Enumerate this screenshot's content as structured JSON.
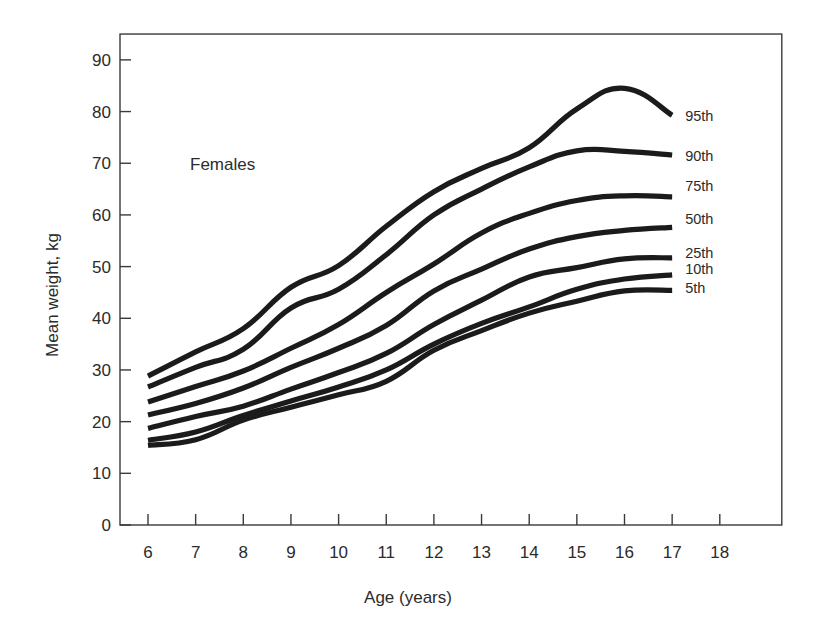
{
  "figure": {
    "annotation": "Females",
    "background": "#ffffff",
    "line_color": "#1b1b1b",
    "axis_color": "#3a3a3a"
  },
  "chart_data": {
    "type": "line",
    "title": "",
    "subtitle": "",
    "annotation": "Females",
    "xlabel": "Age (years)",
    "ylabel": "Mean weight, kg",
    "xlim": [
      6,
      18
    ],
    "ylim": [
      0,
      95
    ],
    "xticks": [
      6,
      7,
      8,
      9,
      10,
      11,
      12,
      13,
      14,
      15,
      16,
      17,
      18
    ],
    "xtick_labels": [
      "6",
      "7",
      "8",
      "9",
      "10",
      "11",
      "12",
      "13",
      "14",
      "15",
      "16",
      "17",
      "18"
    ],
    "yticks": [
      0,
      10,
      20,
      30,
      40,
      50,
      60,
      70,
      80,
      90
    ],
    "ytick_labels": [
      "0",
      "10",
      "20",
      "30",
      "40",
      "50",
      "60",
      "70",
      "80",
      "90"
    ],
    "grid": false,
    "legend_position": "right-inline",
    "x": [
      6,
      7,
      8,
      9,
      10,
      11,
      12,
      13,
      14,
      15,
      16,
      17
    ],
    "series": [
      {
        "name": "95th",
        "label": "95th",
        "label_y": 79.3,
        "values": [
          28.8,
          33.5,
          38.0,
          46.0,
          50.2,
          57.8,
          64.5,
          69.0,
          73.0,
          80.5,
          84.5,
          79.3
        ]
      },
      {
        "name": "90th",
        "label": "90th",
        "label_y": 71.6,
        "values": [
          26.7,
          30.5,
          34.0,
          42.0,
          45.6,
          52.3,
          60.0,
          65.0,
          69.3,
          72.4,
          72.3,
          71.6
        ]
      },
      {
        "name": "75th",
        "label": "75th",
        "label_y": 65.8,
        "values": [
          23.8,
          26.8,
          29.8,
          34.2,
          38.8,
          45.0,
          50.5,
          56.5,
          60.3,
          62.8,
          63.7,
          63.5
        ]
      },
      {
        "name": "50th",
        "label": "50th",
        "label_y": 59.4,
        "values": [
          21.3,
          23.5,
          26.5,
          30.5,
          34.2,
          38.6,
          45.3,
          49.5,
          53.4,
          55.8,
          57.0,
          57.6
        ]
      },
      {
        "name": "25th",
        "label": "25th",
        "label_y": 52.8,
        "values": [
          18.7,
          21.0,
          23.0,
          26.3,
          29.5,
          33.2,
          38.8,
          43.5,
          48.0,
          49.8,
          51.5,
          51.7
        ]
      },
      {
        "name": "10th",
        "label": "10th",
        "label_y": 49.7,
        "values": [
          16.4,
          18.0,
          21.2,
          24.0,
          26.7,
          30.0,
          35.0,
          39.0,
          42.2,
          45.6,
          47.6,
          48.4
        ]
      },
      {
        "name": "5th",
        "label": "5th",
        "label_y": 46.0,
        "values": [
          15.4,
          16.5,
          20.3,
          22.8,
          25.2,
          27.8,
          33.8,
          37.6,
          41.0,
          43.3,
          45.3,
          45.4
        ]
      }
    ]
  }
}
